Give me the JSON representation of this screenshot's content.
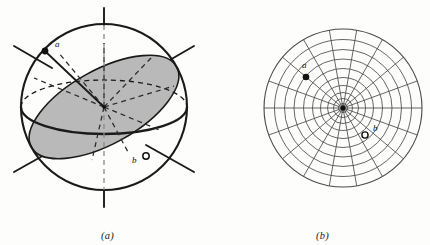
{
  "figure": {
    "background_color": "#fdfdfc",
    "ink_color": "#1a1a1a",
    "shade_color": "#b8b8b8",
    "panels": [
      {
        "id": "panel-a",
        "caption": "(a)",
        "kind": "sphere-projection-diagram",
        "description": "Reference sphere with shaded great-circle plane, equator ellipse and radiating crystallographic axes",
        "sphere": {
          "cx": 104,
          "cy": 107,
          "r": 83
        },
        "equator": {
          "cx": 104,
          "cy": 107,
          "rx": 83,
          "ry": 27
        },
        "great_circle_plane": {
          "cx": 104,
          "cy": 107,
          "rx": 83,
          "ry": 36,
          "rotation_deg": -28,
          "fill": "#b8b8b8"
        },
        "axes": [
          {
            "name": "vertical-axis",
            "angle_deg": 90,
            "style": "solid-outside-dashed-inside"
          },
          {
            "name": "axis-upper-left",
            "angle_deg": 150,
            "style": "solid-outside"
          },
          {
            "name": "axis-upper-right",
            "angle_deg": 30,
            "style": "solid-outside"
          },
          {
            "name": "axis-lower-left",
            "angle_deg": 210,
            "style": "solid-outside"
          },
          {
            "name": "axis-lower-right",
            "angle_deg": 330,
            "style": "solid-outside"
          }
        ],
        "points": [
          {
            "id": "a",
            "label": "a",
            "marker": "filled-dot",
            "x": 44,
            "y": 50,
            "label_x": 54,
            "label_y": 45
          },
          {
            "id": "b",
            "label": "b",
            "marker": "open-dot",
            "x": 146,
            "y": 155,
            "label_x": 134,
            "label_y": 160
          }
        ],
        "radius_line": {
          "from_x": 46,
          "from_y": 52,
          "to_x": 104,
          "to_y": 107
        }
      },
      {
        "id": "panel-b",
        "caption": "(b)",
        "kind": "polar-net",
        "description": "Polar stereographic net: concentric latitude circles and radial meridian lines",
        "net": {
          "cx": 128,
          "cy": 108,
          "outer_radius": 79,
          "ring_radii": [
            4.5,
            9.5,
            15.5,
            22.5,
            30.5,
            39.5,
            49.0,
            58.5,
            68.5,
            79.0
          ],
          "meridian_count": 18,
          "meridian_spacing_deg": 20,
          "center_marker": "filled-dot"
        },
        "points": [
          {
            "id": "a",
            "label": "a",
            "marker": "filled-dot",
            "x": 91,
            "y": 76,
            "label_x": 88,
            "label_y": 66
          },
          {
            "id": "b",
            "label": "b",
            "marker": "open-dot",
            "x": 149,
            "y": 134,
            "label_x": 157,
            "label_y": 129
          }
        ]
      }
    ]
  }
}
